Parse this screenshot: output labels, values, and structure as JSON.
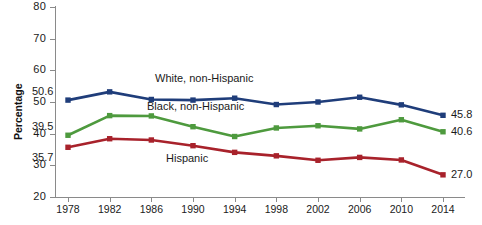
{
  "chart_data": {
    "type": "line",
    "title": "",
    "xlabel": "",
    "ylabel": "Percentage",
    "x": [
      1978,
      1982,
      1986,
      1990,
      1994,
      1998,
      2002,
      2006,
      2010,
      2014
    ],
    "xtick_labels": [
      "1978",
      "1982",
      "1986",
      "1990",
      "1994",
      "1998",
      "2002",
      "2006",
      "2010",
      "2014"
    ],
    "ytick_labels": [
      "20",
      "30",
      "40",
      "50",
      "60",
      "70",
      "80"
    ],
    "yticks": [
      20,
      30,
      40,
      50,
      60,
      70,
      80
    ],
    "ylim": [
      20,
      80
    ],
    "grid": false,
    "legend_position": "inline-annotations",
    "marker": "square",
    "series": [
      {
        "name": "White, non-Hispanic",
        "color": "#1F3D7A",
        "values": [
          50.6,
          53.2,
          50.8,
          50.6,
          51.2,
          49.2,
          50.0,
          51.5,
          49.1,
          45.8
        ],
        "start_label": "50.6",
        "end_label": "45.8",
        "annotation": "White, non-Hispanic"
      },
      {
        "name": "Black, non-Hispanic",
        "color": "#4E9A3E",
        "values": [
          39.5,
          45.7,
          45.6,
          42.2,
          39.1,
          41.8,
          42.5,
          41.5,
          44.4,
          40.6
        ],
        "start_label": "39.5",
        "end_label": "40.6",
        "annotation": "Black, non-Hispanic"
      },
      {
        "name": "Hispanic",
        "color": "#A8222B",
        "values": [
          35.7,
          38.4,
          38.0,
          36.2,
          34.1,
          33.0,
          31.6,
          32.5,
          31.7,
          27.0
        ],
        "start_label": "35.7",
        "end_label": "27.0",
        "annotation": "Hispanic"
      }
    ],
    "annotations": [
      {
        "text": "White, non-Hispanic",
        "x_px": 155,
        "y_px": 72
      },
      {
        "text": "Black, non-Hispanic",
        "x_px": 147,
        "y_px": 100
      },
      {
        "text": "Hispanic",
        "x_px": 166,
        "y_px": 152
      }
    ]
  },
  "axes": {
    "y_title": "Percentage"
  },
  "caption": {
    "cut_off_line": ""
  }
}
